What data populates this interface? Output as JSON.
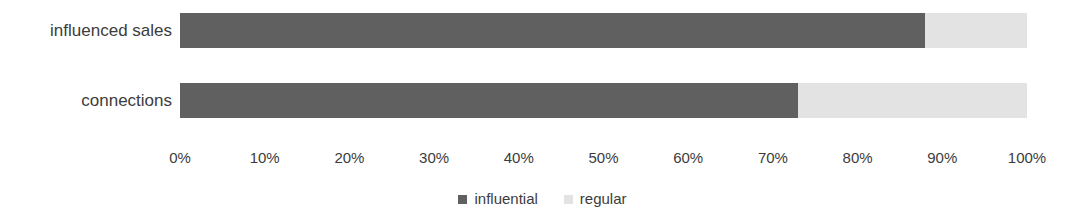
{
  "chart_data": {
    "type": "bar",
    "orientation": "horizontal",
    "stacked": true,
    "stack_mode": "percent",
    "title": "",
    "xlabel": "",
    "ylabel": "",
    "xlim": [
      0,
      100
    ],
    "grid": false,
    "legend_position": "bottom",
    "categories": [
      "influenced sales",
      "connections"
    ],
    "tick_labels": [
      "0%",
      "10%",
      "20%",
      "30%",
      "40%",
      "50%",
      "60%",
      "70%",
      "80%",
      "90%",
      "100%"
    ],
    "tick_values": [
      0,
      10,
      20,
      30,
      40,
      50,
      60,
      70,
      80,
      90,
      100
    ],
    "series": [
      {
        "name": "influential",
        "color": "#606060",
        "values": [
          88,
          73
        ]
      },
      {
        "name": "regular",
        "color": "#e3e3e3",
        "values": [
          12,
          27
        ]
      }
    ]
  },
  "legend": {
    "items": [
      {
        "label": "influential",
        "color": "#606060"
      },
      {
        "label": "regular",
        "color": "#e3e3e3"
      }
    ]
  }
}
